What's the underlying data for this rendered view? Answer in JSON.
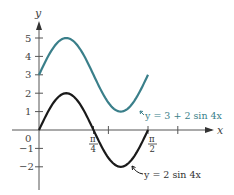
{
  "chart_data": {
    "type": "line",
    "title": "",
    "xlabel": "x",
    "ylabel": "y",
    "xlim": [
      0,
      2.2
    ],
    "ylim": [
      -2.6,
      6
    ],
    "x_ticks": [
      {
        "value": 0.7854,
        "label_top": "π",
        "label_bottom": "4"
      },
      {
        "value": 1.0,
        "label_top": "",
        "label_bottom": ""
      },
      {
        "value": 1.5708,
        "label_top": "π",
        "label_bottom": "2"
      },
      {
        "value": 2.0,
        "label_top": "",
        "label_bottom": ""
      }
    ],
    "y_ticks": [
      -2,
      -1,
      1,
      2,
      3,
      4,
      5
    ],
    "origin_label": "0",
    "series": [
      {
        "name": "y = 3 + 2 sin 4x",
        "color": "#3a7f8a",
        "expr": "3 + 2*sin(4x)",
        "x_range": [
          0,
          1.5708
        ],
        "points": [
          [
            0,
            3
          ],
          [
            0.3927,
            5
          ],
          [
            0.7854,
            3
          ],
          [
            1.1781,
            1
          ],
          [
            1.5708,
            3
          ]
        ]
      },
      {
        "name": "y = 2 sin 4x",
        "color": "#1a1a1a",
        "expr": "2*sin(4x)",
        "x_range": [
          0,
          1.5708
        ],
        "points": [
          [
            0,
            0
          ],
          [
            0.3927,
            2
          ],
          [
            0.7854,
            0
          ],
          [
            1.1781,
            -2
          ],
          [
            1.5708,
            0
          ]
        ]
      }
    ],
    "annotations": [
      {
        "text": "y = 3 + 2 sin 4x",
        "series": 0
      },
      {
        "text": "y = 2 sin 4x",
        "series": 1
      }
    ],
    "grid": false,
    "legend": "none"
  },
  "labels": {
    "x_axis": "x",
    "y_axis": "y",
    "origin": "0",
    "pi": "π",
    "four": "4",
    "two": "2",
    "ann_teal": "y = 3 + 2 sin 4x",
    "ann_black": "y = 2 sin 4x",
    "y5": "5",
    "y4": "4",
    "y3": "3",
    "y2": "2",
    "y1": "1",
    "ym1": "−1",
    "ym2": "−2"
  },
  "colors": {
    "teal": "#3a7f8a",
    "black": "#1a1a1a",
    "axis": "#555555"
  }
}
